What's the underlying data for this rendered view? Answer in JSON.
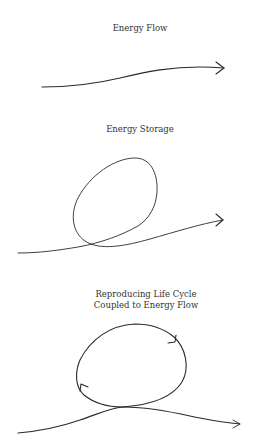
{
  "panels": [
    {
      "id": "energy-flow",
      "title": "Energy Flow",
      "elements": [
        "open-curve",
        "arrowhead-right"
      ]
    },
    {
      "id": "energy-storage",
      "title": "Energy Storage",
      "elements": [
        "flow-curve-with-loop",
        "arrowhead-right"
      ]
    },
    {
      "id": "reproducing-life-cycle",
      "title_line1": "Reproducing Life Cycle",
      "title_line2": "Coupled to Energy Flow",
      "elements": [
        "flow-curve",
        "closed-cycle-loop",
        "cycle-arrow-clockwise-top-right",
        "cycle-arrow-left",
        "arrowhead-right"
      ]
    }
  ],
  "style": {
    "background": "#ffffff",
    "ink": "#2a2a2a",
    "text": "#333333"
  }
}
